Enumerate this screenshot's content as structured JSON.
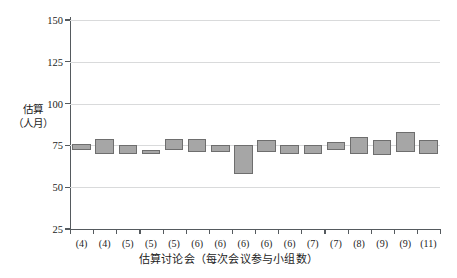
{
  "chart_data": {
    "type": "bar",
    "title": "",
    "subtitle": "",
    "xlabel": "估算讨论会（每次会议参与小组数）",
    "ylabel_lines": [
      "估算",
      "（人月）"
    ],
    "ylabel": "估算（人月）",
    "ylim": [
      25,
      150
    ],
    "yticks": [
      25,
      50,
      75,
      100,
      125,
      150
    ],
    "ytick_labels": [
      "25",
      "50",
      "75",
      "100",
      "125",
      "150"
    ],
    "grid": true,
    "legend": null,
    "series_note": "每个分类为一个区间条（低值-高值）",
    "categories": [
      "(4)",
      "(4)",
      "(5)",
      "(5)",
      "(5)",
      "(6)",
      "(6)",
      "(6)",
      "(6)",
      "(6)",
      "(7)",
      "(7)",
      "(8)",
      "(9)",
      "(9)",
      "(11)"
    ],
    "series": [
      {
        "name": "低值",
        "values": [
          72,
          70,
          70,
          70,
          72,
          71,
          71,
          58,
          71,
          70,
          70,
          72,
          70,
          69,
          71,
          70
        ]
      },
      {
        "name": "高值",
        "values": [
          76,
          79,
          75,
          72,
          79,
          79,
          75,
          75,
          78,
          75,
          75,
          77,
          80,
          78,
          83,
          78
        ]
      }
    ],
    "colors": {
      "bar_fill": "#a6a6a6",
      "bar_border": "#6e6e6e",
      "axis": "#555a5e",
      "grid": "#d9dadb",
      "text": "#1c1c1c",
      "background": "#ffffff"
    }
  }
}
